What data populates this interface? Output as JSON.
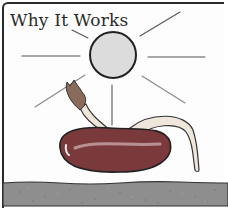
{
  "illustration": {
    "title": "Why It Works",
    "elements": [
      {
        "name": "sun",
        "icon": "sun-icon",
        "description": "grey circle with radiating lines"
      },
      {
        "name": "bean-seed",
        "icon": "bean-icon",
        "description": "dark red kidney bean germinating"
      },
      {
        "name": "shoot",
        "icon": "leaf-sprout-icon",
        "description": "shoot with folded leaves rising to the left"
      },
      {
        "name": "root",
        "icon": "root-icon",
        "description": "pale root curving down to the right"
      },
      {
        "name": "soil",
        "icon": "soil-icon",
        "description": "grey speckled soil band at bottom"
      }
    ]
  },
  "colors": {
    "frame": "#2a2a2a",
    "sun_fill": "#dcdcdc",
    "sun_stroke": "#222222",
    "bean_fill": "#7a3a3c",
    "bean_highlight": "#c9a6a6",
    "root_fill": "#efe7dc",
    "soil_fill": "#8e8e8e",
    "ray": "#555555"
  }
}
